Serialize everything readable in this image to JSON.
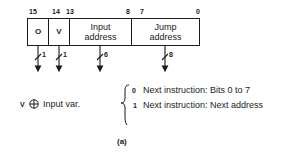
{
  "diagram": {
    "bit_labels": [
      {
        "label": "15",
        "x": 31
      },
      {
        "label": "14",
        "x": 54
      },
      {
        "label": "13",
        "x": 67
      },
      {
        "label": "8",
        "x": 127
      },
      {
        "label": "7",
        "x": 134
      },
      {
        "label": "0",
        "x": 196
      }
    ],
    "fields": [
      {
        "id": "o",
        "label": "O",
        "bits": 1
      },
      {
        "id": "v",
        "label": "V",
        "bits": 1
      },
      {
        "id": "input",
        "label": "Input address",
        "bits": 6
      },
      {
        "id": "jump",
        "label": "Jump address",
        "bits": 8
      }
    ],
    "arrow_widths": [
      "1",
      "1",
      "6",
      "8"
    ],
    "legend_left": {
      "symbol": "V",
      "operator": "⊕",
      "text": "Input var."
    },
    "legend_right": [
      {
        "value": "0",
        "text": "Next instruction: Bits 0 to 7"
      },
      {
        "value": "1",
        "text": "Next instruction: Next address"
      }
    ],
    "caption": "(a)"
  }
}
